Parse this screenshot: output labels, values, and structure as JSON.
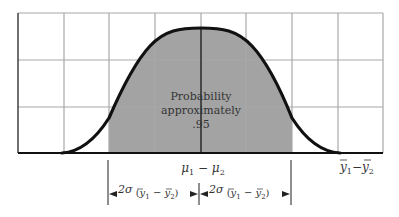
{
  "diagram": {
    "type": "normal-distribution-sampling",
    "shaded_label_lines": [
      "Probability",
      "approximately",
      ".95"
    ],
    "center_label": {
      "mu1": "μ",
      "sub1": "1",
      "minus": " − ",
      "mu2": "μ",
      "sub2": "2"
    },
    "axis_label": {
      "y1": "y",
      "sub1": "1",
      "minus": "−",
      "y2": "y",
      "sub2": "2"
    },
    "interval_left_label": {
      "prefix": "2σ",
      "open": " (",
      "y1": "y",
      "sub1": "1",
      "minus": " − ",
      "y2": "y",
      "sub2": "2",
      "close": ")"
    },
    "interval_right_label": {
      "prefix": "2σ",
      "open": " (",
      "y1": "y",
      "sub1": "1",
      "minus": " − ",
      "y2": "y",
      "sub2": "2",
      "close": ")"
    },
    "colors": {
      "grid": "#a8a8a8",
      "curve": "#111111",
      "shade": "#a3a3a3",
      "axis": "#111111",
      "text": "#333333"
    }
  }
}
